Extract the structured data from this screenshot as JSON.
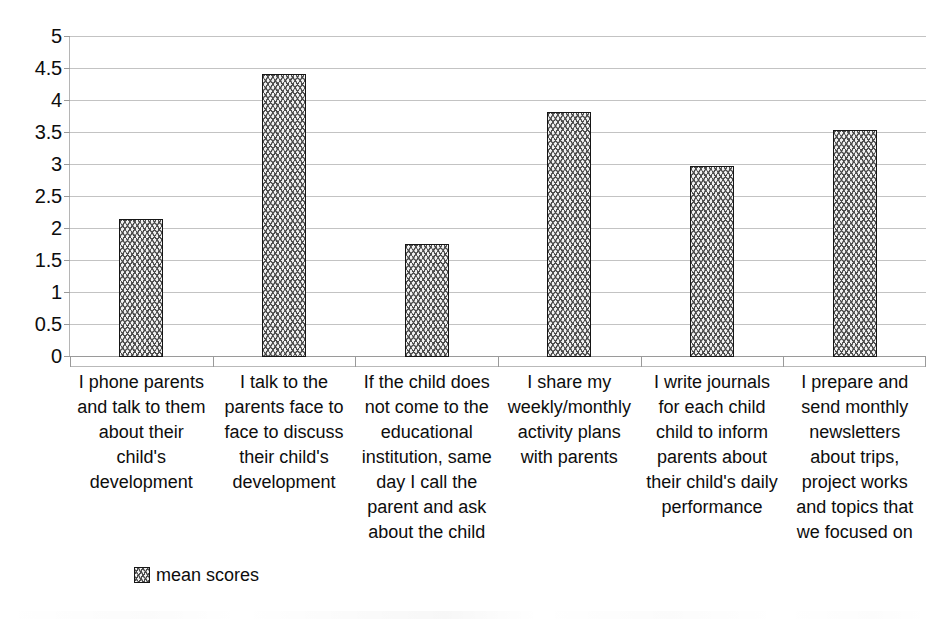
{
  "chart_data": {
    "type": "bar",
    "title": "",
    "xlabel": "",
    "ylabel": "",
    "ylim": [
      0,
      5
    ],
    "ytick_step": 0.5,
    "ytick_labels": [
      "5",
      "4.5",
      "4",
      "3.5",
      "3",
      "2.5",
      "2",
      "1.5",
      "1",
      "0.5",
      "0"
    ],
    "ytick_values": [
      5,
      4.5,
      4,
      3.5,
      3,
      2.5,
      2,
      1.5,
      1,
      0.5,
      0
    ],
    "grid": true,
    "grid_axis": "y",
    "legend_position": "bottom-left",
    "categories": [
      "I phone parents and talk to them about their child's development",
      "I talk to the parents face to face to discuss their child's development",
      "If the child does not come to the educational institution, same day I call the parent and ask about the child",
      "I share my weekly/monthly activity plans with parents",
      "I write journals for each child child to inform parents about their child's daily performance",
      "I prepare and send monthly newsletters about trips, project works and topics that we focused on"
    ],
    "series": [
      {
        "name": "mean scores",
        "values": [
          2.15,
          4.42,
          1.77,
          3.83,
          2.98,
          3.54
        ]
      }
    ]
  },
  "legend": {
    "entries": [
      {
        "label": "mean scores",
        "swatch": "zigzag-pattern-swatch"
      }
    ]
  },
  "colors": {
    "bar_fill": "#f2f2f2",
    "bar_pattern": "#4a4a4a",
    "bar_border": "#161616",
    "gridline": "#c3c3c3",
    "axis_line": "#b5b5b5",
    "text": "#0d0d0d",
    "background": "#ffffff"
  }
}
